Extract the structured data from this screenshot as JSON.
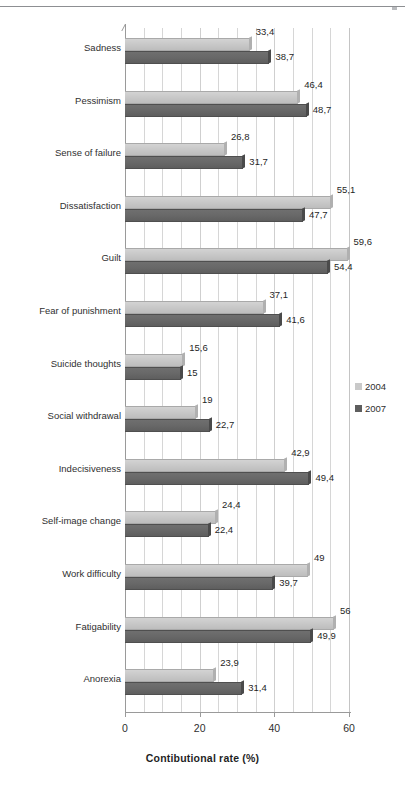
{
  "chart_data": {
    "type": "bar",
    "orientation": "horizontal",
    "title": "",
    "xlabel": "Contibutional rate (%)",
    "ylabel": "",
    "xlim": [
      0,
      60
    ],
    "xticks": [
      "0",
      "20",
      "40",
      "60"
    ],
    "xtick_values": [
      0,
      20,
      40,
      60
    ],
    "grid": "vertical gridlines every 5 units",
    "legend_position": "right",
    "categories": [
      "Sadness",
      "Pessimism",
      "Sense of failure",
      "Dissatisfaction",
      "Guilt",
      "Fear of punishment",
      "Suicide thoughts",
      "Social withdrawal",
      "Indecisiveness",
      "Self-image change",
      "Work difficulty",
      "Fatigability",
      "Anorexia"
    ],
    "series": [
      {
        "name": "2004",
        "color": "#c9c9c9",
        "values": [
          33.4,
          46.4,
          26.8,
          55.1,
          59.6,
          37.1,
          15.6,
          19,
          42.9,
          24.4,
          49,
          56,
          23.9
        ],
        "labels": [
          "33,4",
          "46,4",
          "26,8",
          "55,1",
          "59,6",
          "37,1",
          "15,6",
          "19",
          "42,9",
          "24,4",
          "49",
          "56",
          "23,9"
        ]
      },
      {
        "name": "2007",
        "color": "#5e5e5e",
        "values": [
          38.7,
          48.7,
          31.7,
          47.7,
          54.4,
          41.6,
          15,
          22.7,
          49.4,
          22.4,
          39.7,
          49.9,
          31.4
        ],
        "labels": [
          "38,7",
          "48,7",
          "31,7",
          "47,7",
          "54,4",
          "41,6",
          "15",
          "22,7",
          "49,4",
          "22,4",
          "39,7",
          "49,9",
          "31,4"
        ]
      }
    ]
  },
  "legend": {
    "items": [
      {
        "label": "2004",
        "color": "#c9c9c9"
      },
      {
        "label": "2007",
        "color": "#5e5e5e"
      }
    ]
  }
}
